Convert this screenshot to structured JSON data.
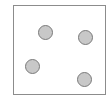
{
  "diagram": {
    "type": "dot-arrangement",
    "frame": {
      "x": 13,
      "y": 5,
      "width": 92,
      "height": 89,
      "border_color": "#8c8c8c"
    },
    "dot_style": {
      "fill": "#c8c8c8",
      "stroke": "#7a7a7a",
      "diameter": 15
    },
    "dots": [
      {
        "id": 1,
        "cx": 45,
        "cy": 32
      },
      {
        "id": 2,
        "cx": 85,
        "cy": 37
      },
      {
        "id": 3,
        "cx": 32,
        "cy": 66
      },
      {
        "id": 4,
        "cx": 84,
        "cy": 79
      }
    ],
    "dot_count": 4
  }
}
